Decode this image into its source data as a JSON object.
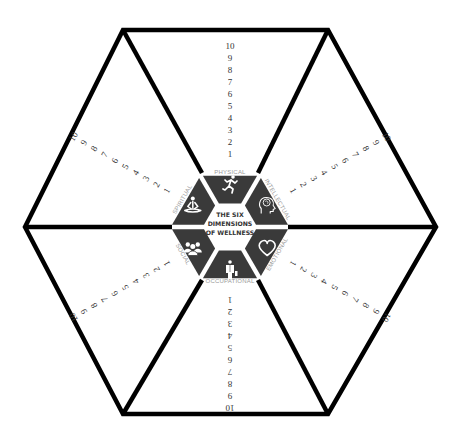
{
  "title": "THE SIX DIMENSIONS OF WELLNESS",
  "title_lines": [
    "THE SIX",
    "DIMENSIONS",
    "OF WELLNESS"
  ],
  "colors": {
    "outline": "#000000",
    "segment_fill": "#3a3a3a",
    "icon": "#ffffff",
    "label": "#9a9a9a",
    "numbers": "#333333",
    "background": "#ffffff"
  },
  "scale": {
    "min": 1,
    "max": 10,
    "ticks": [
      "1",
      "2",
      "3",
      "4",
      "5",
      "6",
      "7",
      "8",
      "9",
      "10"
    ]
  },
  "dimensions": [
    {
      "id": "physical",
      "label": "PHYSICAL",
      "icon": "runner-icon",
      "angle": -90
    },
    {
      "id": "intellectual",
      "label": "INTELLECTUAL",
      "icon": "head-brain-icon",
      "angle": -30
    },
    {
      "id": "emotional",
      "label": "EMOTIONAL",
      "icon": "heart-icon",
      "angle": 30
    },
    {
      "id": "occupational",
      "label": "OCCUPATIONAL",
      "icon": "businessperson-icon",
      "angle": 90
    },
    {
      "id": "social",
      "label": "SOCIAL",
      "icon": "group-people-icon",
      "angle": 150
    },
    {
      "id": "spiritual",
      "label": "SPIRITUAL",
      "icon": "meditation-icon",
      "angle": 210
    }
  ]
}
